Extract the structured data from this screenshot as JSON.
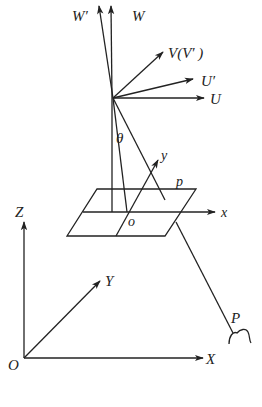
{
  "diagram": {
    "title": "",
    "stroke_color": "#222222",
    "background": "#ffffff",
    "camera_frame": {
      "labels": {
        "W_prime": "W′",
        "W": "W",
        "V": "V(V′ )",
        "U_prime": "U′",
        "U": "U",
        "theta": "θ"
      }
    },
    "image_plane": {
      "labels": {
        "plane": "p",
        "origin": "o",
        "x": "x",
        "y": "y"
      }
    },
    "world_frame": {
      "labels": {
        "Z": "Z",
        "Y": "Y",
        "X": "X",
        "origin": "O"
      }
    },
    "object": {
      "label": "P"
    }
  }
}
